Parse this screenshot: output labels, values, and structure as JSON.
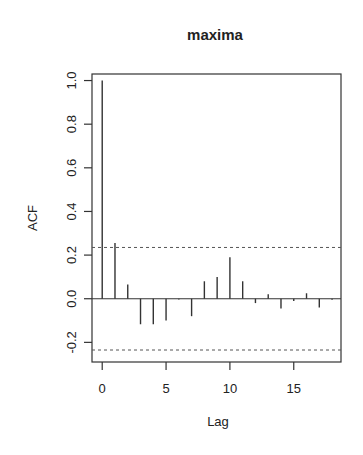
{
  "chart_data": {
    "type": "bar",
    "subtype": "acf-stem",
    "title": "maxima",
    "xlabel": "Lag",
    "ylabel": "ACF",
    "x": [
      0,
      1,
      2,
      3,
      4,
      5,
      6,
      7,
      8,
      9,
      10,
      11,
      12,
      13,
      14,
      15,
      16,
      17,
      18
    ],
    "values": [
      1.0,
      0.255,
      0.065,
      -0.117,
      -0.117,
      -0.1,
      -0.003,
      -0.08,
      0.08,
      0.1,
      0.19,
      0.08,
      -0.02,
      0.02,
      -0.045,
      -0.01,
      0.025,
      -0.04,
      -0.005
    ],
    "confidence_bounds": [
      0.235,
      -0.235
    ],
    "xlim": [
      -0.8,
      18.7
    ],
    "ylim": [
      -0.29,
      1.03
    ],
    "xticks": [
      0,
      5,
      10,
      15
    ],
    "yticks": [
      -0.2,
      0.0,
      0.2,
      0.4,
      0.6,
      0.8,
      1.0
    ],
    "ytick_labels": [
      "-0.2",
      "0.0",
      "0.2",
      "0.4",
      "0.6",
      "0.8",
      "1.0"
    ],
    "grid": false,
    "legend": null
  }
}
